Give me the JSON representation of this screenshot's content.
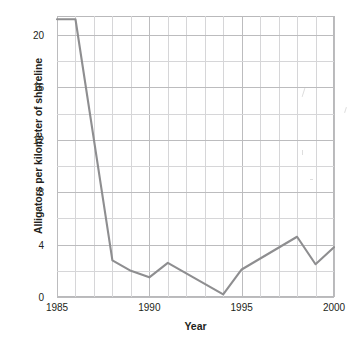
{
  "chart_data": {
    "type": "line",
    "title": "",
    "xlabel": "Year",
    "ylabel": "Alligators per kilometer of shoreline",
    "xlim": [
      1985,
      2000
    ],
    "ylim": [
      0,
      21.45
    ],
    "grid": true,
    "legend": null,
    "x_ticks": [
      1985,
      1990,
      1995,
      2000
    ],
    "x_tick_labels": [
      "1985",
      "1990",
      "1995",
      "2000"
    ],
    "x_minor_step": 1,
    "y_ticks": [
      0,
      4,
      8,
      12,
      16,
      20
    ],
    "y_tick_labels": [
      "0",
      "4",
      "8",
      "12",
      "16",
      "20"
    ],
    "y_minor_step": 2,
    "series": [
      {
        "name": "Alligators per kilometer of shoreline",
        "color": "#8e8e90",
        "x": [
          1985,
          1986,
          1988,
          1989,
          1990,
          1991,
          1994,
          1995,
          1998,
          1999,
          2000
        ],
        "values": [
          21.2,
          21.2,
          2.8,
          2.0,
          1.5,
          2.6,
          0.2,
          2.1,
          4.6,
          2.5,
          3.8
        ]
      }
    ]
  },
  "axis_titles": {
    "x": "Year",
    "y": "Alligators per kilometer of shoreline"
  },
  "colors": {
    "line": "#8e8e90",
    "grid_minor": "#d6d6d8",
    "grid_major": "#bcbcbe",
    "frame": "#b9b9bb",
    "text": "#231f20",
    "background": "#ffffff"
  }
}
